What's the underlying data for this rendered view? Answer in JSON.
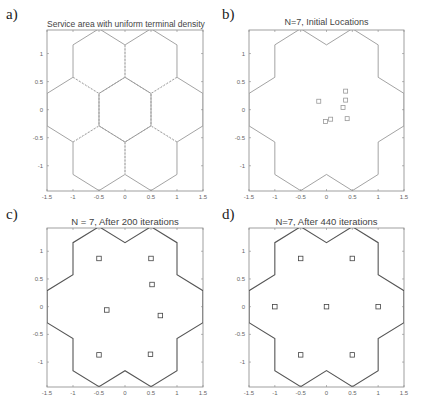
{
  "chart_data": [
    {
      "panel": "a)",
      "type": "diagram",
      "title": "Service area with uniform terminal density",
      "xlim": [
        -1.5,
        1.5
      ],
      "ylim": [
        -1.4,
        1.4
      ],
      "xticks": [
        "-1.5",
        "-1",
        "-0.5",
        "0",
        "0.5",
        "1",
        "1.5"
      ],
      "yticks": [
        "1",
        "0.5",
        "0",
        "-0.5",
        "-1"
      ],
      "hexagons": "7 hexagonal cells (center + 6 surrounding), inner edges dashed",
      "points": []
    },
    {
      "panel": "b)",
      "type": "scatter",
      "title": "N=7, Initial Locations",
      "xlim": [
        -1.5,
        1.5
      ],
      "ylim": [
        -1.4,
        1.4
      ],
      "xticks": [
        "-1.5",
        "-1",
        "-0.5",
        "0",
        "0.5",
        "1",
        "1.5"
      ],
      "yticks": [
        "1",
        "0.5",
        "0",
        "-0.5",
        "-1"
      ],
      "points": [
        [
          -0.15,
          0.15
        ],
        [
          0.37,
          0.33
        ],
        [
          0.37,
          0.17
        ],
        [
          0.32,
          0.04
        ],
        [
          0.08,
          -0.17
        ],
        [
          -0.02,
          -0.21
        ],
        [
          0.4,
          -0.16
        ]
      ]
    },
    {
      "panel": "c)",
      "type": "scatter",
      "title": "N = 7, After 200 iterations",
      "xlim": [
        -1.5,
        1.5
      ],
      "ylim": [
        -1.4,
        1.4
      ],
      "xticks": [
        "-1.5",
        "-1",
        "-0.5",
        "0",
        "0.5",
        "1",
        "1.5"
      ],
      "yticks": [
        "1",
        "0.5",
        "0",
        "-0.5",
        "-1"
      ],
      "points": [
        [
          -0.5,
          0.87
        ],
        [
          0.5,
          0.87
        ],
        [
          0.52,
          0.4
        ],
        [
          -0.35,
          -0.06
        ],
        [
          0.68,
          -0.16
        ],
        [
          -0.5,
          -0.87
        ],
        [
          0.49,
          -0.86
        ]
      ]
    },
    {
      "panel": "d)",
      "type": "scatter",
      "title": "N=7, After 440 iterations",
      "xlim": [
        -1.5,
        1.5
      ],
      "ylim": [
        -1.4,
        1.4
      ],
      "xticks": [
        "-1.5",
        "-1",
        "-0.5",
        "0",
        "0.5",
        "1",
        "1.5"
      ],
      "yticks": [
        "1",
        "0.5",
        "0",
        "-0.5",
        "-1"
      ],
      "points": [
        [
          -0.5,
          0.87
        ],
        [
          0.5,
          0.87
        ],
        [
          -1.0,
          0.0
        ],
        [
          0.0,
          0.0
        ],
        [
          1.0,
          0.0
        ],
        [
          -0.5,
          -0.87
        ],
        [
          0.5,
          -0.87
        ]
      ]
    }
  ],
  "panels": [
    {
      "label": "a)",
      "title": "Service area with uniform terminal density"
    },
    {
      "label": "b)",
      "title": "N=7, Initial Locations"
    },
    {
      "label": "c)",
      "title": "N = 7, After 200 iterations"
    },
    {
      "label": "d)",
      "title": "N=7, After 440 iterations"
    }
  ]
}
